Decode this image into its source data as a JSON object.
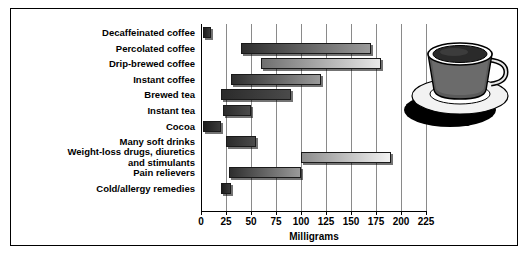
{
  "figure": {
    "frame_color": "#000000",
    "background": "#ffffff"
  },
  "chart_data": {
    "type": "bar",
    "orientation": "horizontal",
    "bar_style": "floating-range",
    "title": "",
    "subtitle": "",
    "xlabel": "Milligrams",
    "ylabel": "",
    "xlim": [
      0,
      225
    ],
    "xticks": [
      0,
      25,
      50,
      75,
      100,
      125,
      150,
      175,
      200,
      225
    ],
    "xticklabels": [
      "0",
      "25",
      "50",
      "75",
      "100",
      "125",
      "150",
      "175",
      "200",
      "225"
    ],
    "grid": true,
    "grid_axis": "x",
    "legend": false,
    "categories": [
      "Decaffeinated coffee",
      "Percolated coffee",
      "Drip-brewed coffee",
      "Instant coffee",
      "Brewed tea",
      "Instant tea",
      "Cocoa",
      "Many soft drinks",
      "Weight-loss drugs, diuretics\nand stimulants",
      "Pain relievers",
      "Cold/allergy remedies"
    ],
    "ranges": [
      {
        "category": "Decaffeinated coffee",
        "low": 2,
        "high": 10,
        "shade": "solid"
      },
      {
        "category": "Percolated coffee",
        "low": 40,
        "high": 170,
        "shade": "mid"
      },
      {
        "category": "Drip-brewed coffee",
        "low": 60,
        "high": 180,
        "shade": "light"
      },
      {
        "category": "Instant coffee",
        "low": 30,
        "high": 120,
        "shade": "mid"
      },
      {
        "category": "Brewed tea",
        "low": 20,
        "high": 90,
        "shade": "dark"
      },
      {
        "category": "Instant tea",
        "low": 22,
        "high": 50,
        "shade": "dark"
      },
      {
        "category": "Cocoa",
        "low": 2,
        "high": 20,
        "shade": "solid"
      },
      {
        "category": "Many soft drinks",
        "low": 25,
        "high": 55,
        "shade": "dark"
      },
      {
        "category": "Weight-loss drugs, diuretics and stimulants",
        "low": 100,
        "high": 190,
        "shade": "verylight"
      },
      {
        "category": "Pain relievers",
        "low": 28,
        "high": 100,
        "shade": "mid"
      },
      {
        "category": "Cold/allergy remedies",
        "low": 20,
        "high": 30,
        "shade": "solid"
      }
    ]
  },
  "artwork": {
    "coffee_cup": "coffee-cup-and-saucer-photo"
  }
}
